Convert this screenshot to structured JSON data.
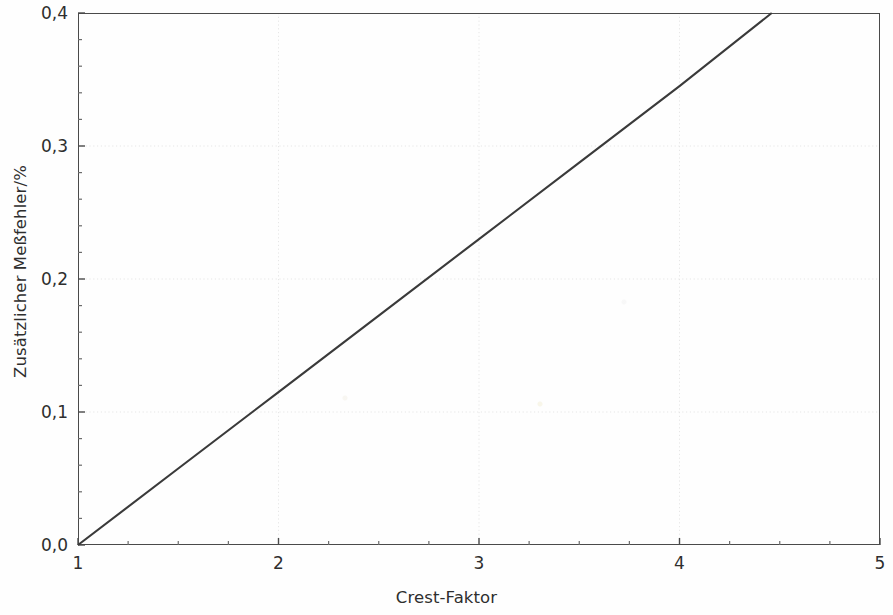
{
  "chart_data": {
    "type": "line",
    "title": "",
    "subtitle": "",
    "xlabel": "Crest-Faktor",
    "ylabel": "Zusätzlicher Meßfehler/%",
    "xlim": [
      1,
      5
    ],
    "ylim": [
      0.0,
      0.4
    ],
    "grid": true,
    "legend": null,
    "legend_position": "none",
    "x_ticks": [
      {
        "value": 1,
        "label": "1"
      },
      {
        "value": 2,
        "label": "2"
      },
      {
        "value": 3,
        "label": "3"
      },
      {
        "value": 4,
        "label": "4"
      },
      {
        "value": 5,
        "label": "5"
      }
    ],
    "x_minor_step": 0.25,
    "y_ticks": [
      {
        "value": 0.0,
        "label": "0,0"
      },
      {
        "value": 0.1,
        "label": "0,1"
      },
      {
        "value": 0.2,
        "label": "0,2"
      },
      {
        "value": 0.3,
        "label": "0,3"
      },
      {
        "value": 0.4,
        "label": "0,4"
      }
    ],
    "y_minor_step": 0.02,
    "series": [
      {
        "name": "Zusätzlicher Meßfehler",
        "color": "#3a3a3a",
        "style": "solid",
        "x": [
          1.0,
          1.5,
          2.0,
          2.5,
          3.0,
          3.5,
          4.0,
          4.46
        ],
        "values": [
          0.0,
          0.0575,
          0.115,
          0.1725,
          0.23,
          0.2875,
          0.345,
          0.4
        ]
      }
    ],
    "annotations": []
  },
  "figure": {
    "background_color": "#ffffff",
    "frame_color": "#4a4a4a",
    "gridline_color": "#e6e6e6"
  }
}
